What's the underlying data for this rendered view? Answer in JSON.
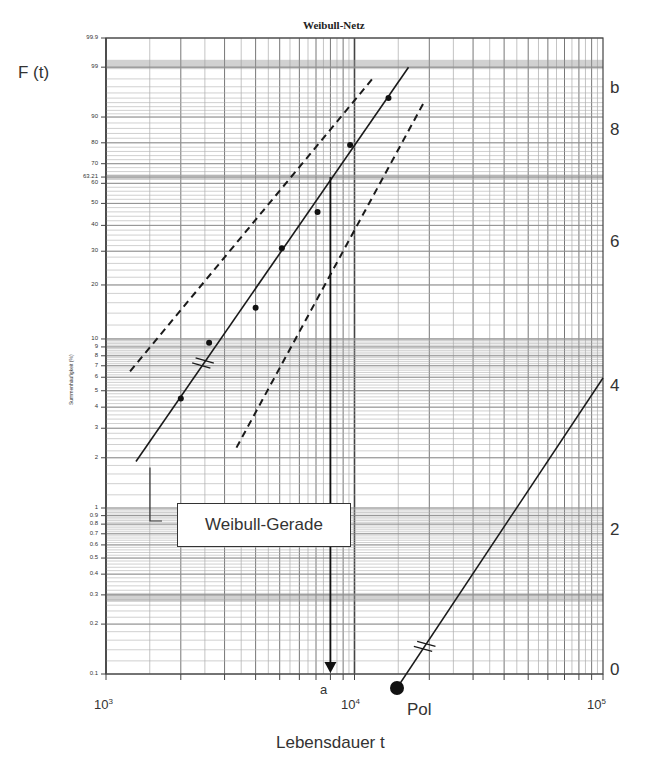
{
  "chart_data": {
    "type": "scatter",
    "title": "Weibull-Netz",
    "xlabel": "Lebensdauer t",
    "ylabel": "F (t)",
    "ylabel_small": "Summenhäufigkeit (%)",
    "x_scale": "log",
    "y_scale": "weibull",
    "xlim": [
      1000,
      100000
    ],
    "ylim": [
      0.1,
      99.9
    ],
    "grid": true,
    "x_ticks": [
      {
        "base": "10",
        "exp": "3"
      },
      {
        "base": "10",
        "exp": "4"
      },
      {
        "base": "10",
        "exp": "5"
      }
    ],
    "y_ticks": [
      "99.9",
      "99",
      "90",
      "80",
      "70",
      "63.21",
      "60",
      "50",
      "40",
      "30",
      "20",
      "10",
      "9",
      "8",
      "7",
      "6",
      "5",
      "4",
      "3",
      "2",
      "1",
      "0.9",
      "0.8",
      "0.7",
      "0.6",
      "0.5",
      "0.4",
      "0.3",
      "0.2",
      "0.1"
    ],
    "b_scale": {
      "label": "b",
      "ticks": [
        "8",
        "6",
        "4",
        "2",
        "0"
      ]
    },
    "series": [
      {
        "name": "Datenpunkte",
        "kind": "points",
        "x": [
          2000,
          2600,
          4000,
          5100,
          7100,
          9600,
          13700
        ],
        "y": [
          4.5,
          9.5,
          15,
          31,
          46,
          79,
          95
        ]
      },
      {
        "name": "Weibull-Gerade",
        "kind": "line",
        "x": [
          1320,
          16500
        ],
        "y": [
          1.9,
          99
        ]
      },
      {
        "name": "Vertrauensgrenze oben",
        "kind": "dashed",
        "x": [
          1250,
          11800
        ],
        "y": [
          6.5,
          98
        ]
      },
      {
        "name": "Vertrauensgrenze unten",
        "kind": "dashed",
        "x": [
          3350,
          19000
        ],
        "y": [
          2.3,
          94
        ]
      },
      {
        "name": "b-Gerade (Pol)",
        "kind": "line",
        "x": [
          15000,
          100000
        ],
        "b": [
          0,
          4.1
        ]
      }
    ],
    "annotations": {
      "characteristic_life_marker": "a",
      "characteristic_life_F": "63.21",
      "characteristic_life_t": 8000,
      "pole_label": "Pol",
      "legend_label": "Weibull-Gerade",
      "shape_parameter_b": 4.1
    }
  }
}
